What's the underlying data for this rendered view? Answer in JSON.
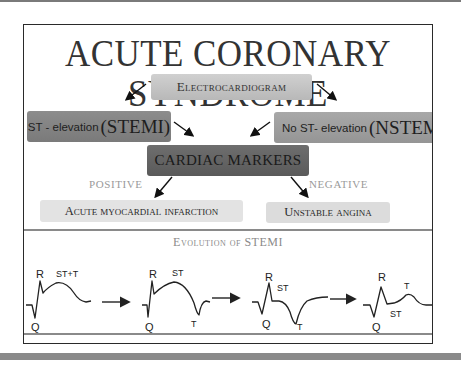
{
  "title": "ACUTE CORONARY SYNDROME",
  "flow": {
    "electrocardiogram": "Electrocardiogram",
    "stemi": {
      "prefix": "ST - elevation",
      "abbrev": "(STEMI)"
    },
    "nstemi": {
      "prefix": "No ST- elevation",
      "abbrev": "(NSTEMI"
    },
    "cardiac_markers": "CARDIAC MARKERS",
    "positive_label": "POSITIVE",
    "negative_label": "NEGATIVE",
    "positive_result": "Acute myocardial infarction",
    "negative_result": "Unstable angina"
  },
  "evolution": {
    "title": "Evolution of STEMI",
    "stages": [
      {
        "labels": [
          "R",
          "ST+T",
          "Q"
        ]
      },
      {
        "labels": [
          "R",
          "ST",
          "Q",
          "T"
        ]
      },
      {
        "labels": [
          "R",
          "ST",
          "Q",
          "T"
        ]
      },
      {
        "labels": [
          "R",
          "T",
          "ST",
          "Q"
        ]
      }
    ]
  },
  "colors": {
    "ecg_box": "#c4c4c4",
    "stemi_box": "#838383",
    "nstemi_box": "#9e9e9e",
    "markers_box": "#646464",
    "result_box": "#e0e0e0",
    "muted_text": "#9a9a9a"
  }
}
